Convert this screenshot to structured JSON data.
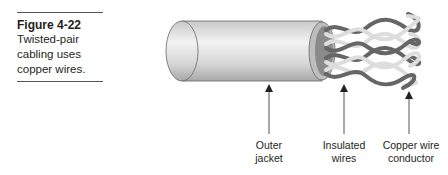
{
  "caption": {
    "figure_number": "Figure 4-22",
    "text": "Twisted-pair cabling uses copper wires."
  },
  "illustration": {
    "subject": "twisted-pair-cable",
    "labels": [
      {
        "line1": "Outer",
        "line2": "jacket"
      },
      {
        "line1": "Insulated",
        "line2": "wires"
      },
      {
        "line1": "Copper wire",
        "line2": "conductor"
      }
    ]
  }
}
